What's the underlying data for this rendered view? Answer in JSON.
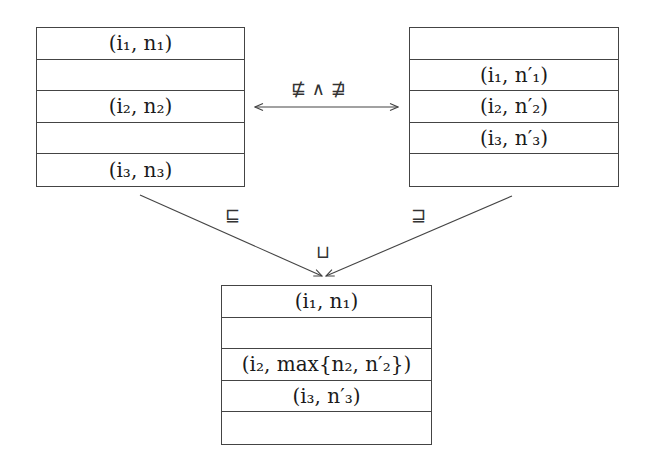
{
  "diagram": {
    "left_table": {
      "rows": [
        "(i₁, n₁)",
        "",
        "(i₂, n₂)",
        "",
        "(i₃, n₃)"
      ]
    },
    "right_table": {
      "rows": [
        "",
        "(i₁, n′₁)",
        "(i₂, n′₂)",
        "(i₃, n′₃)",
        ""
      ]
    },
    "merged_table": {
      "rows": [
        "(i₁, n₁)",
        "",
        "(i₂, max{n₂, n′₂})",
        "(i₃, n′₃)",
        ""
      ]
    },
    "edges": {
      "incomparable_label": "⋢ ∧ ⋣",
      "left_to_merge_label": "⊑",
      "right_to_merge_label": "⊒",
      "join_label": "⊔"
    }
  }
}
